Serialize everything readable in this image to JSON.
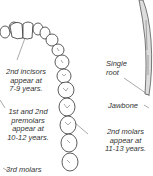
{
  "labels": {
    "incisors": [
      "2nd incisors",
      "appear at",
      "7-9 years."
    ],
    "premolars": [
      "1st and 2nd",
      "premolars",
      "appear at",
      "10-12 years."
    ],
    "molars3": [
      "3rd molars"
    ],
    "single_root": [
      "Single",
      "root"
    ],
    "jawbone": "Jawbone",
    "molars2": [
      "2nd molars",
      "appear at",
      "11-13 years."
    ]
  }
}
